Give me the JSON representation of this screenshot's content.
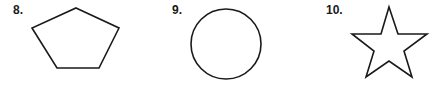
{
  "items": [
    {
      "number": "8.",
      "shape": "pentagon"
    },
    {
      "number": "9.",
      "shape": "circle"
    },
    {
      "number": "10.",
      "shape": "star"
    }
  ],
  "colors": {
    "stroke": "#1a1a1a",
    "background": "#ffffff",
    "fill": "#ffffff"
  }
}
